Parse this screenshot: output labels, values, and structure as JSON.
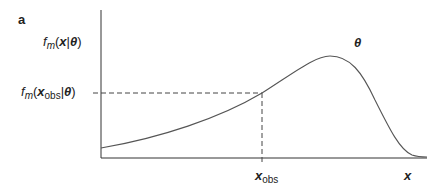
{
  "panel_label": "a",
  "y_labels": {
    "top": {
      "f": "f",
      "sub": "m",
      "open": "(",
      "x": "x",
      "bar": "|",
      "theta": "θ",
      "close": ")"
    },
    "obs": {
      "f": "f",
      "sub": "m",
      "open": "(",
      "x": "x",
      "x_sub": "obs",
      "bar": "|",
      "theta": "θ",
      "close": ")"
    }
  },
  "theta_label": "θ",
  "x_labels": {
    "obs": "x",
    "obs_sub": "obs",
    "axis": "x"
  },
  "colors": {
    "axis": "#333333",
    "curve": "#555555",
    "dashed": "#444444"
  }
}
